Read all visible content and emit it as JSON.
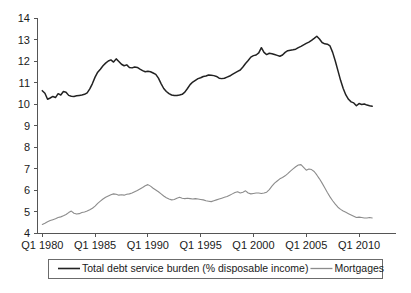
{
  "chart_data": {
    "type": "line",
    "title": "",
    "xlabel": "",
    "ylabel": "",
    "ylim": [
      4,
      14
    ],
    "ytick_labels": [
      "4",
      "5",
      "6",
      "7",
      "8",
      "9",
      "10",
      "11",
      "12",
      "13",
      "14"
    ],
    "yticks": [
      4,
      5,
      6,
      7,
      8,
      9,
      10,
      11,
      12,
      13,
      14
    ],
    "xtick_labels": [
      "Q1 1980",
      "Q1 1985",
      "Q1 1990",
      "Q1 1995",
      "Q1 2000",
      "Q1 2005",
      "Q1 2010"
    ],
    "xticks": [
      1980.0,
      1985.0,
      1990.0,
      1995.0,
      2000.0,
      2005.0,
      2010.0
    ],
    "xlim": [
      1979.5,
      2013.5
    ],
    "grid": false,
    "legend_position": "bottom",
    "colors": {
      "total_debt_service_burden": "#222222",
      "mortgages": "#8c8c8c",
      "axis": "#555555",
      "legend_border": "#6b6b6b",
      "background": "#ffffff"
    },
    "x_start_quarter": "Q1 1980",
    "x_step_years": 0.25,
    "series": [
      {
        "name": "Total debt service burden (% disposable income)",
        "color": "#222222",
        "values": [
          10.62,
          10.5,
          10.22,
          10.28,
          10.35,
          10.3,
          10.48,
          10.42,
          10.58,
          10.55,
          10.4,
          10.36,
          10.35,
          10.38,
          10.4,
          10.42,
          10.45,
          10.52,
          10.7,
          10.95,
          11.25,
          11.48,
          11.62,
          11.78,
          11.9,
          12.0,
          12.05,
          11.95,
          12.1,
          11.98,
          11.85,
          11.78,
          11.82,
          11.7,
          11.68,
          11.72,
          11.7,
          11.62,
          11.55,
          11.5,
          11.52,
          11.5,
          11.44,
          11.38,
          11.2,
          10.95,
          10.72,
          10.58,
          10.48,
          10.42,
          10.4,
          10.4,
          10.42,
          10.45,
          10.55,
          10.72,
          10.9,
          11.02,
          11.1,
          11.18,
          11.22,
          11.28,
          11.3,
          11.35,
          11.34,
          11.32,
          11.28,
          11.2,
          11.18,
          11.2,
          11.25,
          11.3,
          11.38,
          11.45,
          11.52,
          11.58,
          11.72,
          11.88,
          12.02,
          12.18,
          12.25,
          12.28,
          12.38,
          12.62,
          12.4,
          12.3,
          12.36,
          12.34,
          12.3,
          12.26,
          12.22,
          12.28,
          12.4,
          12.48,
          12.5,
          12.52,
          12.55,
          12.62,
          12.68,
          12.75,
          12.82,
          12.88,
          12.96,
          13.05,
          13.15,
          13.02,
          12.86,
          12.8,
          12.78,
          12.7,
          12.4,
          12.0,
          11.55,
          11.1,
          10.72,
          10.42,
          10.22,
          10.1,
          10.05,
          9.92,
          10.02,
          9.98,
          10.0,
          9.95,
          9.92,
          9.9
        ]
      },
      {
        "name": "Mortgages",
        "color": "#8c8c8c",
        "values": [
          4.4,
          4.45,
          4.52,
          4.58,
          4.62,
          4.66,
          4.72,
          4.75,
          4.8,
          4.86,
          4.95,
          5.02,
          4.92,
          4.88,
          4.9,
          4.95,
          4.98,
          5.02,
          5.08,
          5.15,
          5.25,
          5.38,
          5.48,
          5.58,
          5.66,
          5.72,
          5.78,
          5.82,
          5.8,
          5.76,
          5.78,
          5.76,
          5.8,
          5.82,
          5.86,
          5.92,
          5.98,
          6.05,
          6.12,
          6.2,
          6.25,
          6.18,
          6.08,
          6.0,
          5.92,
          5.82,
          5.72,
          5.64,
          5.58,
          5.54,
          5.56,
          5.62,
          5.66,
          5.62,
          5.6,
          5.62,
          5.6,
          5.58,
          5.6,
          5.58,
          5.56,
          5.54,
          5.5,
          5.48,
          5.46,
          5.5,
          5.54,
          5.58,
          5.62,
          5.66,
          5.7,
          5.76,
          5.82,
          5.88,
          5.92,
          5.86,
          5.9,
          5.96,
          5.86,
          5.82,
          5.84,
          5.86,
          5.86,
          5.84,
          5.86,
          5.9,
          6.02,
          6.18,
          6.32,
          6.42,
          6.52,
          6.58,
          6.66,
          6.76,
          6.88,
          6.98,
          7.08,
          7.16,
          7.18,
          7.05,
          6.92,
          6.98,
          6.95,
          6.86,
          6.7,
          6.52,
          6.32,
          6.1,
          5.88,
          5.68,
          5.5,
          5.34,
          5.2,
          5.1,
          5.02,
          4.96,
          4.9,
          4.84,
          4.78,
          4.72,
          4.74,
          4.72,
          4.7,
          4.7,
          4.72,
          4.7
        ]
      }
    ]
  },
  "legend": {
    "entries": [
      {
        "label": "Total debt service burden (% disposable income)",
        "swatch": "line-swatch-black"
      },
      {
        "label": "Mortgages",
        "swatch": "line-swatch-gray"
      }
    ]
  }
}
